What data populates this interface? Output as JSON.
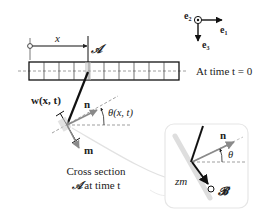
{
  "diagram": {
    "type": "beam-kinematics",
    "frame": {
      "e1_label": "e",
      "e1_sub": "1",
      "e2_label": "e",
      "e2_sub": "2",
      "e3_label": "e",
      "e3_sub": "3"
    },
    "beam": {
      "cells": 10,
      "position_label": "x",
      "section_label": "𝒜",
      "caption": "At time t = 0"
    },
    "deformed": {
      "displacement_label": "w(x, t)",
      "normal_label": "n",
      "tangent_label": "m",
      "angle_label": "θ(x, t)",
      "caption_line1": "Cross section",
      "caption_line2_symbol": "𝒜",
      "caption_line2_text": " at time t"
    },
    "inset": {
      "normal_label": "n",
      "angle_label": "θ",
      "offset_label": "zm",
      "point_label": "𝓑"
    },
    "colors": {
      "ink": "#111111",
      "arrow_grey": "#8a8a8a",
      "dash_grey": "#888888",
      "shadow_grey": "#dcdcdc",
      "inset_border": "#e6e6e6"
    }
  }
}
